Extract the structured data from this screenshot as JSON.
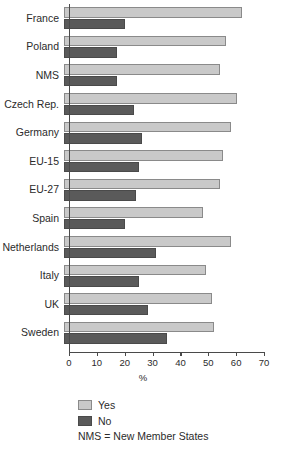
{
  "chart_data": {
    "type": "bar",
    "orientation": "horizontal",
    "title": "",
    "xlabel": "%",
    "ylabel": "",
    "xlim": [
      0,
      70
    ],
    "xticks": [
      0,
      10,
      20,
      30,
      40,
      50,
      60,
      70
    ],
    "grid": false,
    "legend_position": "below-left",
    "categories": [
      "France",
      "Poland",
      "NMS",
      "Czech Rep.",
      "Germany",
      "EU-15",
      "EU-27",
      "Spain",
      "Netherlands",
      "Italy",
      "UK",
      "Sweden"
    ],
    "series": [
      {
        "name": "Yes",
        "color": "#c9c9c9",
        "values": [
          64,
          58,
          56,
          62,
          60,
          57,
          56,
          50,
          60,
          51,
          53,
          54
        ]
      },
      {
        "name": "No",
        "color": "#5a5a5a",
        "values": [
          22,
          19,
          19,
          25,
          28,
          27,
          26,
          22,
          33,
          27,
          30,
          37
        ]
      }
    ],
    "annotations": [
      "NMS = New Member States"
    ]
  },
  "legend": {
    "items": [
      {
        "label": "Yes"
      },
      {
        "label": "No"
      }
    ]
  },
  "footnote": "NMS = New Member States",
  "axis": {
    "x_title": "%"
  }
}
